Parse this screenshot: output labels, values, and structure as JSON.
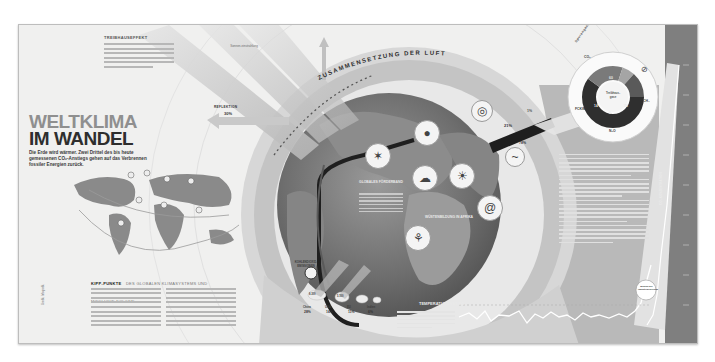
{
  "header": {
    "title_line1": "WELTKLIMA",
    "title_line2": "IM WANDEL",
    "lead": "Die Erde wird wärmer. Zwei Drittel des bis heute gemessenen CO₂-Anstiegs gehen auf das Verbrennen fossiler Energien zurück."
  },
  "greenhouse": {
    "kicker": "TREIBHAUSEFFEKT",
    "reflection_label": "REFLEKTION",
    "reflection_value": "30%",
    "incoming_label": "Sonnen-einstrahlung"
  },
  "atmosphere": {
    "arc_title": "ZUSAMMENSETZUNG DER LUFT",
    "nitrogen_pct": "78%",
    "oxygen_pct": "21%",
    "other_pct": "1%",
    "nitrogen_label": "Stickstoff",
    "oxygen_label": "Sauerstoff"
  },
  "donut": {
    "title": "Spurengase",
    "center_label": "Treibhaus-gase",
    "segments": [
      {
        "label": "CO₂",
        "value": "60",
        "color": "#2f2f2f"
      },
      {
        "label": "CH₄",
        "value": "20",
        "color": "#7a7a7a"
      },
      {
        "label": "N₂O",
        "value": "6",
        "color": "#a5a5a5"
      },
      {
        "label": "FCKW",
        "value": "14",
        "color": "#5a5a5a"
      }
    ]
  },
  "globe": {
    "center_kicker": "GLOBALES FÖRDERBAND",
    "africa_label": "WÜSTENBILDUNG IN AFRIKA",
    "co2_label": "KOHLENDIOXID-EMISSIONEN",
    "emission_bars": [
      {
        "label": "China",
        "value": "8.300"
      },
      {
        "label": "USA",
        "value": "5.100"
      },
      {
        "label": "EU",
        "value": "3.500"
      },
      {
        "label": "Indien",
        "value": "1.800"
      }
    ],
    "emission_shares": [
      "28%",
      "16%",
      "11%",
      "6%"
    ]
  },
  "map": {
    "caption_bold": "KIPP-PUNKTE",
    "caption_rest": "DES GLOBALEN KLIMASYSTEMS UND MÖGLICHE FOLGEN"
  },
  "temperature": {
    "title": "TEMPERATURANSTIEG",
    "badge": "Beginn der Industrialisierung"
  },
  "side_text": {
    "bar_label": "CO₂-KONZENTRATION"
  },
  "credit": "Grafik: Infografik"
}
